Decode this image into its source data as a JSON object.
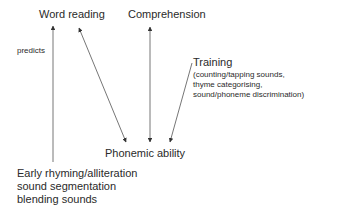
{
  "diagram": {
    "nodes": {
      "word_reading": {
        "label": "Word reading"
      },
      "comprehension": {
        "label": "Comprehension"
      },
      "training": {
        "label": "Training",
        "details": [
          "(counting/tapping sounds,",
          "thyme categorising,",
          "sound/phoneme discrimination)"
        ]
      },
      "phonemic_ability": {
        "label": "Phonemic ability"
      },
      "early_skills": {
        "lines": [
          "Early rhyming/alliteration",
          "sound segmentation",
          "blending sounds"
        ]
      }
    },
    "edges": [
      {
        "from": "early_skills",
        "to": "word_reading",
        "label": "predicts",
        "bidirectional": false
      },
      {
        "from": "phonemic_ability",
        "to": "word_reading",
        "label": "",
        "bidirectional": true
      },
      {
        "from": "phonemic_ability",
        "to": "comprehension",
        "label": "",
        "bidirectional": true
      },
      {
        "from": "training",
        "to": "phonemic_ability",
        "label": "",
        "bidirectional": false
      }
    ],
    "colors": {
      "text": "#2a2a2a",
      "line": "#555555"
    }
  }
}
